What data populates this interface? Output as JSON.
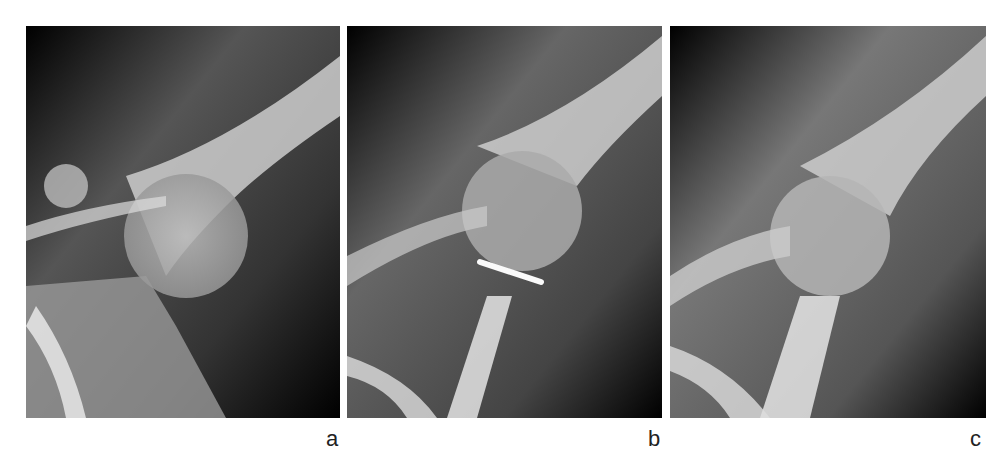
{
  "figure": {
    "panels": [
      {
        "label": "a",
        "description": "Shoulder radiograph, anterior dislocation of humeral head"
      },
      {
        "label": "b",
        "description": "Shoulder radiograph after reduction with fixation pin"
      },
      {
        "label": "c",
        "description": "Shoulder radiograph, follow-up without pin"
      }
    ]
  }
}
